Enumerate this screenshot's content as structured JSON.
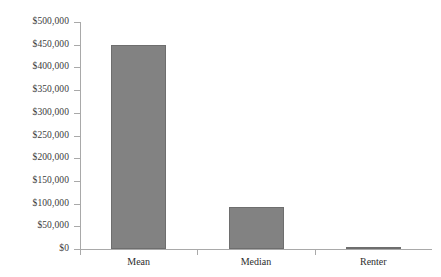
{
  "chart_data": {
    "type": "bar",
    "title": "",
    "subtitle": "",
    "xlabel": "",
    "ylabel": "",
    "categories": [
      "Mean",
      "Median",
      "Renter"
    ],
    "values": [
      450000,
      92000,
      4000
    ],
    "value_labels": [
      "$450,000",
      "$92,000",
      "$4,000"
    ],
    "ylim": [
      0,
      500000
    ],
    "ytick_values": [
      0,
      50000,
      100000,
      150000,
      200000,
      250000,
      300000,
      350000,
      400000,
      450000,
      500000
    ],
    "ytick_labels": [
      "$0",
      "$50,000",
      "$100,000",
      "$150,000",
      "$200,000",
      "$250,000",
      "$300,000",
      "$350,000",
      "$400,000",
      "$450,000",
      "$500,000"
    ],
    "grid": false,
    "legend": false,
    "legend_position": "none",
    "series": [
      {
        "name": "Net worth",
        "values": [
          450000,
          92000,
          4000
        ]
      }
    ],
    "colors": {
      "bar_fill": "#828282",
      "bar_stroke": "#6e6e6e",
      "axis": "#a9a9a9",
      "tick_label": "#3b3b3b",
      "category_label": "#2e2e2e",
      "background": "#ffffff"
    }
  }
}
